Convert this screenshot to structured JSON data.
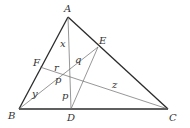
{
  "diagram": {
    "type": "triangle-cevians",
    "colors": {
      "triangle": "#2a2a2a",
      "cevian": "#6a6a6a",
      "label": "#333333",
      "background": "#ffffff"
    },
    "points": {
      "A": {
        "label": "A",
        "x": 68,
        "y": 17
      },
      "B": {
        "label": "B",
        "x": 19,
        "y": 109
      },
      "C": {
        "label": "C",
        "x": 168,
        "y": 109
      },
      "D": {
        "label": "D",
        "x": 71,
        "y": 109
      },
      "E": {
        "label": "E",
        "x": 98,
        "y": 47
      },
      "F": {
        "label": "F",
        "x": 40,
        "y": 67
      },
      "P": {
        "label": "P",
        "x": 70,
        "y": 75
      }
    },
    "segment_labels": {
      "x": "x",
      "y": "y",
      "z": "z",
      "p1": "p",
      "p2": "p",
      "q": "q",
      "r": "r"
    }
  }
}
